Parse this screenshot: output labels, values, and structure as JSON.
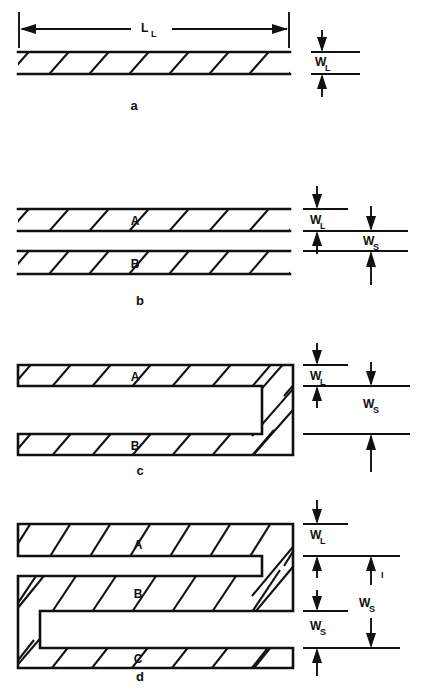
{
  "figure": {
    "background_color": "#ffffff",
    "ink_color": "#111111",
    "panel_letters": {
      "a": "a",
      "b": "b",
      "c": "c",
      "d": "d"
    },
    "dimension_labels": {
      "line_length": "L",
      "line_length_sub": "L",
      "line_width": "W",
      "line_width_sub": "L",
      "space_width": "W",
      "space_width_sub": "S",
      "space_width_alt": "W",
      "space_width_alt_sub": "S",
      "space_width_alt_sup": "I"
    },
    "panels": [
      {
        "id": "a",
        "letter": "a",
        "description": "Single hatched conductor line",
        "segment_labels": [],
        "dimensions": [
          "L_L",
          "W_L"
        ]
      },
      {
        "id": "b",
        "letter": "b",
        "description": "Two parallel hatched conductor lines separated by a space",
        "segment_labels": [
          "A",
          "B"
        ],
        "dimensions": [
          "W_L",
          "W_S"
        ]
      },
      {
        "id": "c",
        "letter": "c",
        "description": "Two conductor lines joined by a hairpin turn at the right end",
        "segment_labels": [
          "A",
          "B"
        ],
        "dimensions": [
          "W_L",
          "W_S"
        ]
      },
      {
        "id": "d",
        "letter": "d",
        "description": "Three conductor lines in a serpentine meander with turns at both ends",
        "segment_labels": [
          "A",
          "B",
          "C"
        ],
        "dimensions": [
          "W_L",
          "W_S",
          "W_S_I",
          "W_S"
        ]
      }
    ]
  }
}
